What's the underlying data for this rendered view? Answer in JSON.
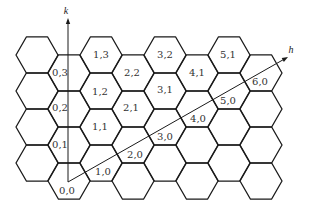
{
  "diagram": {
    "colors": {
      "line": "#1a1a1a",
      "text": "#333333",
      "background": "#ffffff"
    },
    "hex_grid": {
      "side": 21,
      "columns": [
        {
          "cx": 37,
          "centers_y": [
            55,
            91,
            127,
            163
          ]
        },
        {
          "cx": 69,
          "centers_y": [
            73,
            109,
            145,
            181
          ]
        },
        {
          "cx": 101,
          "centers_y": [
            55,
            91,
            127,
            163
          ]
        },
        {
          "cx": 133,
          "centers_y": [
            73,
            109,
            145,
            181
          ]
        },
        {
          "cx": 165,
          "centers_y": [
            55,
            91,
            127,
            163
          ]
        },
        {
          "cx": 197,
          "centers_y": [
            73,
            109,
            145,
            181
          ]
        },
        {
          "cx": 229,
          "centers_y": [
            55,
            91,
            127,
            163
          ]
        },
        {
          "cx": 261,
          "centers_y": [
            73,
            109,
            145,
            181
          ]
        }
      ]
    },
    "axes": {
      "k": {
        "label": "k",
        "from": [
          68,
          182
        ],
        "to": [
          68,
          18
        ],
        "label_pos": [
          66,
          14
        ]
      },
      "h": {
        "label": "h",
        "from": [
          68,
          182
        ],
        "to": [
          288,
          57
        ],
        "label_pos": [
          291,
          53
        ]
      }
    },
    "cell_labels": [
      {
        "text": "0,0",
        "x": 67,
        "y": 194
      },
      {
        "text": "1,0",
        "x": 103,
        "y": 175
      },
      {
        "text": "2,0",
        "x": 135,
        "y": 158
      },
      {
        "text": "3,0",
        "x": 165,
        "y": 140
      },
      {
        "text": "4,0",
        "x": 198,
        "y": 122
      },
      {
        "text": "5,0",
        "x": 228,
        "y": 104
      },
      {
        "text": "6,0",
        "x": 260,
        "y": 85
      },
      {
        "text": "0,1",
        "x": 60,
        "y": 148
      },
      {
        "text": "0,2",
        "x": 60,
        "y": 111
      },
      {
        "text": "0,3",
        "x": 60,
        "y": 76
      },
      {
        "text": "1,1",
        "x": 100,
        "y": 130
      },
      {
        "text": "1,2",
        "x": 100,
        "y": 95
      },
      {
        "text": "1,3",
        "x": 101,
        "y": 58
      },
      {
        "text": "2,1",
        "x": 131,
        "y": 111
      },
      {
        "text": "2,2",
        "x": 132,
        "y": 76
      },
      {
        "text": "3,1",
        "x": 165,
        "y": 93
      },
      {
        "text": "3,2",
        "x": 165,
        "y": 58
      },
      {
        "text": "4,1",
        "x": 197,
        "y": 76
      },
      {
        "text": "5,1",
        "x": 228,
        "y": 58
      }
    ]
  }
}
